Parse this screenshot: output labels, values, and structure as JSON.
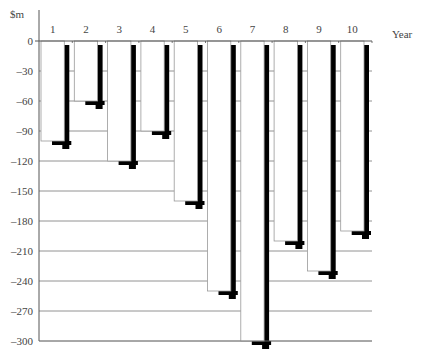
{
  "chart_data": {
    "type": "bar",
    "title": "",
    "xlabel": "Year",
    "ylabel": "$m",
    "categories": [
      "1",
      "2",
      "3",
      "4",
      "5",
      "6",
      "7",
      "8",
      "9",
      "10"
    ],
    "values": [
      -100,
      -60,
      -120,
      -90,
      -160,
      -250,
      -300,
      -200,
      -230,
      -190
    ],
    "ylim": [
      -300,
      0
    ],
    "yticks": [
      0,
      -30,
      -60,
      -90,
      -120,
      -150,
      -180,
      -210,
      -240,
      -270,
      -300
    ],
    "ytick_labels": [
      "0",
      "–30",
      "–60",
      "–90",
      "–120",
      "–150",
      "–180",
      "–210",
      "–240",
      "–270",
      "–300"
    ],
    "grid": true,
    "legend": null,
    "style": "white bars with black drop-shadow, x-axis labels at top"
  },
  "colors": {
    "bar_fill": "#ffffff",
    "bar_edge": "#999999",
    "shadow": "#000000",
    "grid": "#777777",
    "axis": "#555555",
    "text": "#444444"
  }
}
